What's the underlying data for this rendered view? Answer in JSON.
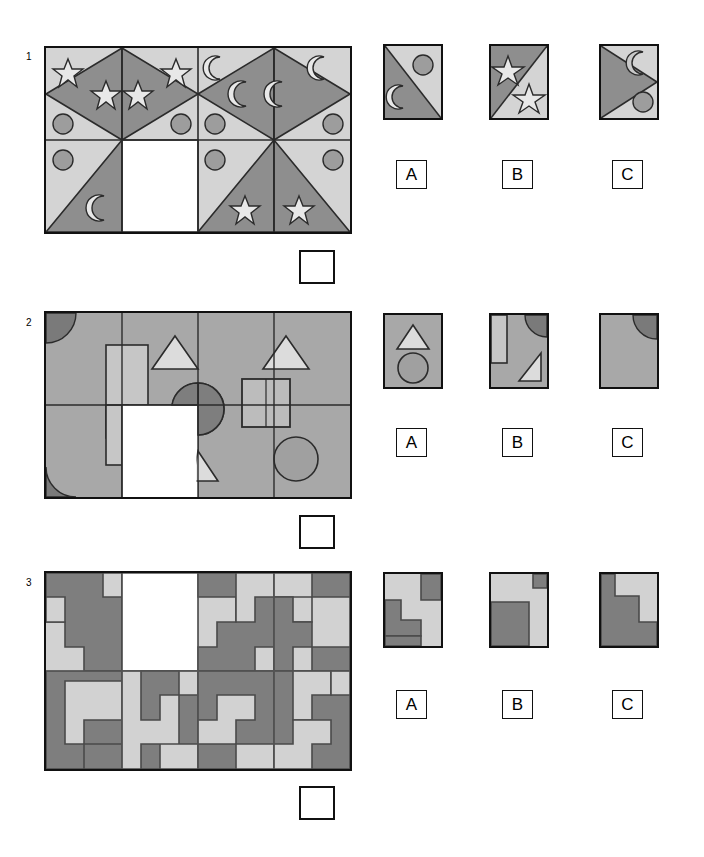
{
  "document": {
    "type": "visual-reasoning-matrix-test",
    "clipped_header_text": "",
    "page_width": 704,
    "page_height": 857
  },
  "palette": {
    "light_gray": "#d4d4d4",
    "mid_gray": "#a8a8a8",
    "dark_gray": "#8a8a8a",
    "darker_gray": "#777777",
    "p2_background": "#a8a8a8",
    "p2_light_shape": "#c8c8c8",
    "p2_pale_shape": "#dcdcdc",
    "p2_dark_shape": "#7a7a7a",
    "p3_light": "#d2d2d2",
    "p3_dark": "#7e7e7e",
    "white": "#ffffff",
    "stroke": "#2b2b2b",
    "border": "#111111"
  },
  "puzzles": [
    {
      "number": "1",
      "grid": {
        "columns": 4,
        "rows": 2,
        "missing_cell": {
          "row": 2,
          "col": 2
        }
      },
      "theme": "triangles-with-stars-moons-circles",
      "cells": [
        {
          "row": 1,
          "col": 1,
          "pattern": "left-diamond-half",
          "icons": [
            "star",
            "star",
            "circle"
          ]
        },
        {
          "row": 1,
          "col": 2,
          "pattern": "right-diamond-half",
          "icons": [
            "star",
            "star",
            "circle"
          ]
        },
        {
          "row": 1,
          "col": 3,
          "pattern": "left-diamond-half",
          "icons": [
            "moon",
            "moon",
            "circle"
          ]
        },
        {
          "row": 1,
          "col": 4,
          "pattern": "right-diamond-half",
          "icons": [
            "moon",
            "moon",
            "circle"
          ]
        },
        {
          "row": 2,
          "col": 1,
          "pattern": "right-triangle-dark",
          "icons": [
            "circle",
            "moon"
          ]
        },
        {
          "row": 2,
          "col": 2,
          "pattern": "blank-missing",
          "icons": []
        },
        {
          "row": 2,
          "col": 3,
          "pattern": "left-triangle-dark",
          "icons": [
            "circle",
            "star"
          ]
        },
        {
          "row": 2,
          "col": 4,
          "pattern": "right-triangle-dark",
          "icons": [
            "circle",
            "star"
          ]
        }
      ],
      "options": [
        {
          "label": "A",
          "description": "diagonal split, circle top-right, moon bottom-left"
        },
        {
          "label": "B",
          "description": "diagonal split, star top-left, star bottom-right"
        },
        {
          "label": "C",
          "description": "left-pointing triangle, moon top-right, circle bottom-right"
        }
      ]
    },
    {
      "number": "2",
      "grid": {
        "columns": 4,
        "rows": 2,
        "missing_cell": {
          "row": 2,
          "col": 2
        }
      },
      "theme": "gray-field-with-overlapping-shapes",
      "cells": [
        {
          "row": 1,
          "col": 1,
          "icons": [
            "quarter-circle-dark-topleft"
          ]
        },
        {
          "row": 1,
          "col": 2,
          "icons": [
            "tall-light-rectangle",
            "triangle-up"
          ]
        },
        {
          "row": 1,
          "col": 3,
          "icons": [
            "triangle-up",
            "dark-circle"
          ]
        },
        {
          "row": 1,
          "col": 4,
          "icons": [
            "triangle-up",
            "nested-squares"
          ]
        },
        {
          "row": 2,
          "col": 1,
          "icons": [
            "quarter-circle-dark-bottomleft",
            "tall-light-rectangle"
          ]
        },
        {
          "row": 2,
          "col": 2,
          "icons": [
            "blank-missing"
          ]
        },
        {
          "row": 2,
          "col": 3,
          "icons": [
            "small-triangle",
            "dark-circle"
          ]
        },
        {
          "row": 2,
          "col": 4,
          "icons": [
            "nested-squares",
            "circle"
          ]
        }
      ],
      "options": [
        {
          "label": "A",
          "description": "triangle above circle outline"
        },
        {
          "label": "B",
          "description": "light rectangle left, quarter circle top-right, small triangle lower-right"
        },
        {
          "label": "C",
          "description": "plain gray with quarter circle top-right"
        }
      ]
    },
    {
      "number": "3",
      "grid": {
        "columns": 4,
        "rows": 2,
        "missing_cell": {
          "row": 1,
          "col": 2
        }
      },
      "theme": "staircase-step-patterns",
      "cells": [
        {
          "row": 1,
          "col": 1,
          "pattern": "descending-steps-dark"
        },
        {
          "row": 1,
          "col": 2,
          "pattern": "blank-missing"
        },
        {
          "row": 1,
          "col": 3,
          "pattern": "descending-steps-dark"
        },
        {
          "row": 1,
          "col": 4,
          "pattern": "descending-steps-light"
        },
        {
          "row": 2,
          "col": 1,
          "pattern": "descending-steps-dark"
        },
        {
          "row": 2,
          "col": 2,
          "pattern": "descending-steps-light"
        },
        {
          "row": 2,
          "col": 3,
          "pattern": "descending-steps-dark"
        },
        {
          "row": 2,
          "col": 4,
          "pattern": "descending-steps-light"
        }
      ],
      "options": [
        {
          "label": "A",
          "description": "light field, dark block top-right, dark L bottom-left"
        },
        {
          "label": "B",
          "description": "light field, small dark square top-right, dark block bottom-left"
        },
        {
          "label": "C",
          "description": "dark field left and bottom, light step upper-right"
        }
      ]
    }
  ]
}
